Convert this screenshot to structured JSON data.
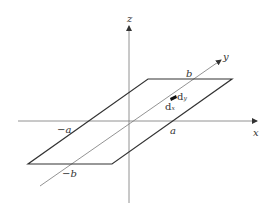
{
  "diagram": {
    "title": "",
    "axes": {
      "x": {
        "label": "x"
      },
      "y": {
        "label": "y"
      },
      "z": {
        "label": "z"
      }
    },
    "ticks": {
      "neg_a": "−a",
      "pos_a": "a",
      "neg_b": "−b",
      "pos_b": "b"
    },
    "element": {
      "dx_label": "d",
      "dx_sub": "x",
      "dy_label": "d",
      "dy_sub": "y"
    },
    "colors": {
      "axis": "#777777",
      "plate": "#333333",
      "element": "#111111"
    }
  }
}
